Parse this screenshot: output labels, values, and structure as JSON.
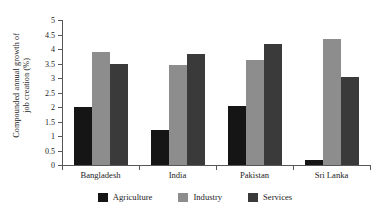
{
  "chart_data": {
    "type": "bar",
    "title": "",
    "subtitle": "",
    "xlabel": "",
    "ylabel": "Compounded annual growth of job creation (%)",
    "ylabel_line1": "Compounded annual growth of",
    "ylabel_line2": "job creation (%)",
    "categories": [
      "Bangladesh",
      "India",
      "Pakistan",
      "Sri Lanka"
    ],
    "series": [
      {
        "name": "Agriculture",
        "color": "#151515",
        "values": [
          2.0,
          1.22,
          2.03,
          0.18
        ]
      },
      {
        "name": "Industry",
        "color": "#8d8d8d",
        "values": [
          3.9,
          3.45,
          3.62,
          4.34
        ]
      },
      {
        "name": "Services",
        "color": "#3a3a3a",
        "values": [
          3.48,
          3.82,
          4.19,
          3.03
        ]
      }
    ],
    "ylim": [
      0,
      5
    ],
    "ytick_values": [
      0,
      0.5,
      1,
      1.5,
      2,
      2.5,
      3,
      3.5,
      4,
      4.5,
      5
    ],
    "ytick_labels": [
      "0",
      "0.5",
      "1",
      "1.5",
      "2",
      "2.5",
      "3",
      "3.5",
      "4",
      "4.5",
      "5"
    ],
    "grid": false,
    "legend_position": "bottom",
    "legend_entries": [
      "Agriculture",
      "Industry",
      "Services"
    ],
    "annotations": []
  }
}
